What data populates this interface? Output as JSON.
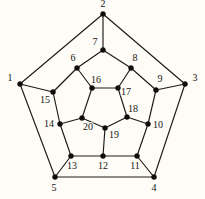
{
  "figure": {
    "background_color": "#fdfcf7",
    "line_color": "#1c1a17",
    "label_color": "#181511",
    "width": 205,
    "height": 199
  },
  "graph": {
    "name": "dodecahedron-graph",
    "vertex_count": 20,
    "edge_count": 30,
    "vertices": [
      {
        "id": 1,
        "label": "1",
        "x": 20,
        "y": 84,
        "label_x": 10,
        "label_y": 79
      },
      {
        "id": 2,
        "label": "2",
        "x": 103,
        "y": 14,
        "label_x": 103,
        "label_y": 5
      },
      {
        "id": 3,
        "label": "3",
        "x": 185,
        "y": 84,
        "label_x": 195,
        "label_y": 79
      },
      {
        "id": 4,
        "label": "4",
        "x": 154,
        "y": 177,
        "label_x": 154,
        "label_y": 189
      },
      {
        "id": 5,
        "label": "5",
        "x": 55,
        "y": 177,
        "label_x": 54,
        "label_y": 189
      },
      {
        "id": 6,
        "label": "6",
        "x": 77,
        "y": 68,
        "label_x": 73,
        "label_y": 59
      },
      {
        "id": 7,
        "label": "7",
        "x": 103,
        "y": 50,
        "label_x": 95,
        "label_y": 43
      },
      {
        "id": 8,
        "label": "8",
        "x": 131,
        "y": 68,
        "label_x": 135,
        "label_y": 59
      },
      {
        "id": 9,
        "label": "9",
        "x": 156,
        "y": 90,
        "label_x": 160,
        "label_y": 80
      },
      {
        "id": 10,
        "label": "10",
        "x": 148,
        "y": 124,
        "label_x": 158,
        "label_y": 126
      },
      {
        "id": 11,
        "label": "11",
        "x": 137,
        "y": 156,
        "label_x": 135,
        "label_y": 167
      },
      {
        "id": 12,
        "label": "12",
        "x": 103,
        "y": 156,
        "label_x": 103,
        "label_y": 167
      },
      {
        "id": 13,
        "label": "13",
        "x": 71,
        "y": 156,
        "label_x": 72,
        "label_y": 167
      },
      {
        "id": 14,
        "label": "14",
        "x": 60,
        "y": 124,
        "label_x": 49,
        "label_y": 125
      },
      {
        "id": 15,
        "label": "15",
        "x": 53,
        "y": 92,
        "label_x": 45,
        "label_y": 101
      },
      {
        "id": 16,
        "label": "16",
        "x": 92,
        "y": 88,
        "label_x": 96,
        "label_y": 81
      },
      {
        "id": 17,
        "label": "17",
        "x": 118,
        "y": 88,
        "label_x": 126,
        "label_y": 93
      },
      {
        "id": 18,
        "label": "18",
        "x": 127,
        "y": 117,
        "label_x": 133,
        "label_y": 110
      },
      {
        "id": 19,
        "label": "19",
        "x": 105,
        "y": 128,
        "label_x": 114,
        "label_y": 136
      },
      {
        "id": 20,
        "label": "20",
        "x": 82,
        "y": 118,
        "label_x": 88,
        "label_y": 128
      }
    ],
    "edges": [
      {
        "from": 1,
        "to": 2,
        "group": "outer-pentagon"
      },
      {
        "from": 2,
        "to": 3,
        "group": "outer-pentagon"
      },
      {
        "from": 3,
        "to": 4,
        "group": "outer-pentagon"
      },
      {
        "from": 4,
        "to": 5,
        "group": "outer-pentagon"
      },
      {
        "from": 5,
        "to": 1,
        "group": "outer-pentagon"
      },
      {
        "from": 1,
        "to": 15,
        "group": "spoke-outer"
      },
      {
        "from": 2,
        "to": 7,
        "group": "spoke-outer"
      },
      {
        "from": 3,
        "to": 9,
        "group": "spoke-outer"
      },
      {
        "from": 4,
        "to": 11,
        "group": "spoke-outer"
      },
      {
        "from": 5,
        "to": 13,
        "group": "spoke-outer"
      },
      {
        "from": 15,
        "to": 6,
        "group": "middle-ring"
      },
      {
        "from": 6,
        "to": 7,
        "group": "middle-ring"
      },
      {
        "from": 7,
        "to": 8,
        "group": "middle-ring"
      },
      {
        "from": 8,
        "to": 9,
        "group": "middle-ring"
      },
      {
        "from": 9,
        "to": 10,
        "group": "middle-ring"
      },
      {
        "from": 10,
        "to": 11,
        "group": "middle-ring"
      },
      {
        "from": 11,
        "to": 12,
        "group": "middle-ring"
      },
      {
        "from": 12,
        "to": 13,
        "group": "middle-ring"
      },
      {
        "from": 13,
        "to": 14,
        "group": "middle-ring"
      },
      {
        "from": 14,
        "to": 15,
        "group": "middle-ring"
      },
      {
        "from": 6,
        "to": 16,
        "group": "spoke-inner"
      },
      {
        "from": 8,
        "to": 17,
        "group": "spoke-inner"
      },
      {
        "from": 10,
        "to": 18,
        "group": "spoke-inner"
      },
      {
        "from": 12,
        "to": 19,
        "group": "spoke-inner"
      },
      {
        "from": 14,
        "to": 20,
        "group": "spoke-inner"
      },
      {
        "from": 16,
        "to": 17,
        "group": "inner-pentagon"
      },
      {
        "from": 17,
        "to": 18,
        "group": "inner-pentagon"
      },
      {
        "from": 18,
        "to": 19,
        "group": "inner-pentagon"
      },
      {
        "from": 19,
        "to": 20,
        "group": "inner-pentagon"
      },
      {
        "from": 20,
        "to": 16,
        "group": "inner-pentagon"
      }
    ]
  }
}
